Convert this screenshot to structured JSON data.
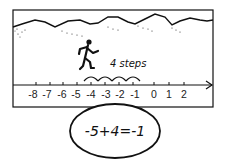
{
  "scene": {
    "caption": "4 steps",
    "equation": "-5+4=-1"
  },
  "number_line": {
    "labels": [
      "-8",
      "-7",
      "-6",
      "-5",
      "-4",
      "-3",
      "-2",
      "-1",
      "0",
      "1",
      "2"
    ],
    "start_value": -5,
    "steps": 4,
    "end_value": -1
  },
  "colors": {
    "ink": "#111111",
    "background": "#ffffff"
  }
}
